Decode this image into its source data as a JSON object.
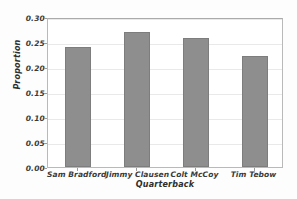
{
  "chart_data": {
    "type": "bar",
    "title": "",
    "xlabel": "Quarterback",
    "ylabel": "Proportion",
    "categories": [
      "Sam Bradford",
      "Jimmy Clausen",
      "Colt McCoy",
      "Tim Tebow"
    ],
    "values": [
      0.24,
      0.27,
      0.258,
      0.222
    ],
    "ylim": [
      0.0,
      0.3
    ],
    "yticks": [
      0.0,
      0.05,
      0.1,
      0.15,
      0.2,
      0.25,
      0.3
    ],
    "ytick_labels": [
      "0.00",
      "0.05",
      "0.10",
      "0.15",
      "0.20",
      "0.25",
      "0.30"
    ],
    "grid": true,
    "legend": false,
    "bar_color": "#8e8e8e",
    "bar_edge_color": "#7d7d7d",
    "grid_color": "#e9e9e9",
    "frame_color": "#b9b9b9",
    "background_color": "#ffffff"
  }
}
